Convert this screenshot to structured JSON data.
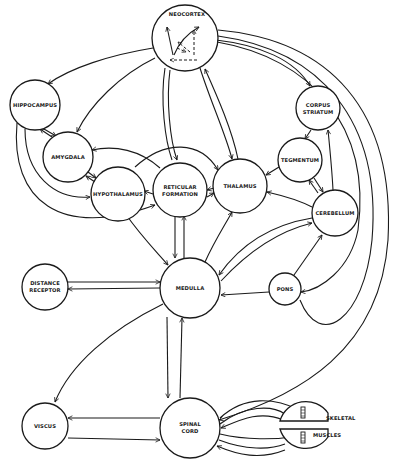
{
  "diagram": {
    "type": "neural-pathway-flow-diagram",
    "nodes": {
      "neocortex": {
        "label": "NEOCORTEX"
      },
      "hippocampus": {
        "label": "HIPPOCAMPUS"
      },
      "amygdala": {
        "label": "AMYGDALA"
      },
      "hypothalamus": {
        "label": "HYPOTHALAMUS"
      },
      "reticular_formation": {
        "line1": "RETICULAR",
        "line2": "FORMATION"
      },
      "thalamus": {
        "label": "THALAMUS"
      },
      "corpus_striatum": {
        "line1": "CORPUS",
        "line2": "STRIATUM"
      },
      "tegmentum": {
        "label": "TEGMENTUM"
      },
      "cerebellum": {
        "label": "CEREBELLUM"
      },
      "distance_receptor": {
        "line1": "DISTANCE",
        "line2": "RECEPTOR"
      },
      "medulla": {
        "label": "MEDULLA"
      },
      "pons": {
        "label": "PONS"
      },
      "viscus": {
        "label": "VISCUS"
      },
      "spinal_cord": {
        "line1": "SPINAL",
        "line2": "CORD"
      },
      "skeletal_muscles": {
        "line1": "SKELETAL",
        "line2": "MUSCLES"
      }
    },
    "edges": [
      {
        "from": "neocortex",
        "to": "hippocampus"
      },
      {
        "from": "neocortex",
        "to": "amygdala"
      },
      {
        "from": "neocortex",
        "to": "corpus_striatum"
      },
      {
        "from": "neocortex",
        "to": "reticular_formation"
      },
      {
        "from": "neocortex",
        "to": "thalamus"
      },
      {
        "from": "thalamus",
        "to": "neocortex"
      },
      {
        "from": "neocortex",
        "to": "spinal_cord"
      },
      {
        "from": "hippocampus",
        "to": "amygdala"
      },
      {
        "from": "amygdala",
        "to": "hippocampus"
      },
      {
        "from": "hippocampus",
        "to": "hypothalamus"
      },
      {
        "from": "hippocampus",
        "to": "reticular_formation"
      },
      {
        "from": "amygdala",
        "to": "hypothalamus"
      },
      {
        "from": "hypothalamus",
        "to": "amygdala"
      },
      {
        "from": "reticular_formation",
        "to": "hypothalamus"
      },
      {
        "from": "hypothalamus",
        "to": "thalamus"
      },
      {
        "from": "reticular_formation",
        "to": "thalamus"
      },
      {
        "from": "thalamus",
        "to": "reticular_formation"
      },
      {
        "from": "hypothalamus",
        "to": "medulla"
      },
      {
        "from": "reticular_formation",
        "to": "medulla"
      },
      {
        "from": "medulla",
        "to": "reticular_formation"
      },
      {
        "from": "medulla",
        "to": "thalamus"
      },
      {
        "from": "corpus_striatum",
        "to": "tegmentum"
      },
      {
        "from": "cerebellum",
        "to": "corpus_striatum"
      },
      {
        "from": "tegmentum",
        "to": "thalamus"
      },
      {
        "from": "tegmentum",
        "to": "cerebellum"
      },
      {
        "from": "cerebellum",
        "to": "tegmentum"
      },
      {
        "from": "cerebellum",
        "to": "thalamus"
      },
      {
        "from": "cerebellum",
        "to": "medulla"
      },
      {
        "from": "medulla",
        "to": "cerebellum"
      },
      {
        "from": "pons",
        "to": "cerebellum"
      },
      {
        "from": "pons",
        "to": "medulla"
      },
      {
        "from": "neocortex",
        "to": "pons"
      },
      {
        "from": "distance_receptor",
        "to": "medulla"
      },
      {
        "from": "medulla",
        "to": "distance_receptor"
      },
      {
        "from": "medulla",
        "to": "spinal_cord"
      },
      {
        "from": "spinal_cord",
        "to": "medulla"
      },
      {
        "from": "medulla",
        "to": "viscus"
      },
      {
        "from": "spinal_cord",
        "to": "viscus"
      },
      {
        "from": "viscus",
        "to": "spinal_cord"
      },
      {
        "from": "spinal_cord",
        "to": "skeletal_muscles"
      },
      {
        "from": "skeletal_muscles",
        "to": "spinal_cord"
      }
    ]
  }
}
